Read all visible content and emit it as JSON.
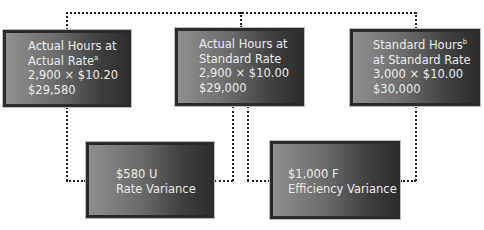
{
  "diagram": {
    "type": "labor-variance-diagram",
    "top_boxes": [
      {
        "id": "actual-hours-actual-rate",
        "lines": [
          "Actual Hours at",
          "Actual Rate",
          "2,900 × $10.20",
          "$29,580"
        ],
        "superscript": "a",
        "superscript_line": 1
      },
      {
        "id": "actual-hours-standard-rate",
        "lines": [
          "Actual Hours at",
          "Standard Rate",
          "2,900 × $10.00",
          "$29,000"
        ],
        "superscript": "",
        "superscript_line": -1
      },
      {
        "id": "standard-hours-standard-rate",
        "lines": [
          "Standard Hours",
          "at Standard Rate",
          "3,000 × $10.00",
          "$30,000"
        ],
        "superscript": "b",
        "superscript_line": 0
      }
    ],
    "variance_boxes": [
      {
        "id": "rate-variance",
        "amount": "$580 U",
        "label": "Rate Variance"
      },
      {
        "id": "efficiency-variance",
        "amount": "$1,000 F",
        "label": "Efficiency Variance"
      }
    ],
    "colors": {
      "box_gradient_light": "#8f8f8f",
      "box_gradient_dark": "#2e2e2e",
      "box_border": "#2b2b2b",
      "text": "#ececec",
      "connector": "#222222"
    }
  }
}
